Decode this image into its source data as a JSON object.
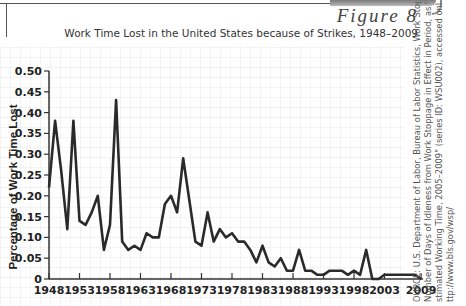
{
  "header": {
    "figure_label": "Figure 8",
    "title": "Work Time Lost in the United States because of Strikes, 1948–2009"
  },
  "source": {
    "lines": [
      "OURCE: U.S. Department of Labor, Bureau of Labor Statistics, Work Stoppage Data,",
      "Number of Days of Idleness from Work Stoppage in Effect in Period, as % of Total",
      "stimated Working Time, 2005–2009\" (series ID: WSU002), accessed online at",
      "ttp://www.bls.gov/wsp/"
    ]
  },
  "colors": {
    "line": "#2a2a2a",
    "axis": "#333333",
    "text": "#222222"
  },
  "chart_data": {
    "type": "line",
    "title": "Work Time Lost in the United States because of Strikes, 1948–2009",
    "xlabel": "",
    "ylabel": "Percentage of Work Time Lost",
    "ylim": [
      0,
      0.5
    ],
    "xlim": [
      1948,
      2009
    ],
    "grid": true,
    "legend": "none",
    "x_tick_labels": [
      "1948",
      "1953",
      "1958",
      "1963",
      "1968",
      "1973",
      "1978",
      "1983",
      "1988",
      "1993",
      "1998",
      "2003",
      "2009"
    ],
    "x_ticks": [
      1948,
      1953,
      1958,
      1963,
      1968,
      1973,
      1978,
      1983,
      1988,
      1993,
      1998,
      2003,
      2009
    ],
    "y_tick_labels": [
      "0",
      "0.05",
      "0.10",
      "0.15",
      "0.20",
      "0.25",
      "0.30",
      "0.35",
      "0.40",
      "0.45",
      "0.50"
    ],
    "y_ticks": [
      0,
      0.05,
      0.1,
      0.15,
      0.2,
      0.25,
      0.3,
      0.35,
      0.4,
      0.45,
      0.5
    ],
    "x": [
      1948,
      1949,
      1950,
      1951,
      1952,
      1953,
      1954,
      1955,
      1956,
      1957,
      1958,
      1959,
      1960,
      1961,
      1962,
      1963,
      1964,
      1965,
      1966,
      1967,
      1968,
      1969,
      1970,
      1971,
      1972,
      1973,
      1974,
      1975,
      1976,
      1977,
      1978,
      1979,
      1980,
      1981,
      1982,
      1983,
      1984,
      1985,
      1986,
      1987,
      1988,
      1989,
      1990,
      1991,
      1992,
      1993,
      1994,
      1995,
      1996,
      1997,
      1998,
      1999,
      2000,
      2001,
      2002,
      2003,
      2004,
      2005,
      2006,
      2007,
      2008,
      2009
    ],
    "series": [
      {
        "name": "Percentage of Work Time Lost",
        "values": [
          0.22,
          0.38,
          0.26,
          0.12,
          0.38,
          0.14,
          0.13,
          0.16,
          0.2,
          0.07,
          0.13,
          0.43,
          0.09,
          0.07,
          0.08,
          0.07,
          0.11,
          0.1,
          0.1,
          0.18,
          0.2,
          0.16,
          0.29,
          0.19,
          0.09,
          0.08,
          0.16,
          0.09,
          0.12,
          0.1,
          0.11,
          0.09,
          0.09,
          0.07,
          0.04,
          0.08,
          0.04,
          0.03,
          0.05,
          0.02,
          0.02,
          0.07,
          0.02,
          0.02,
          0.01,
          0.01,
          0.02,
          0.02,
          0.02,
          0.01,
          0.02,
          0.01,
          0.07,
          0.0,
          0.0,
          0.01,
          0.01,
          0.01,
          0.01,
          0.01,
          0.01,
          0.0
        ]
      }
    ]
  }
}
